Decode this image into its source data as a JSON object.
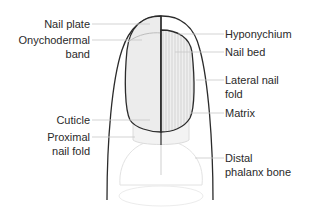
{
  "diagram": {
    "labels_left": [
      {
        "id": "nail-plate",
        "lines": [
          "Nail plate"
        ]
      },
      {
        "id": "onychodermal-band",
        "lines": [
          "Onychodermal",
          "band"
        ]
      },
      {
        "id": "cuticle",
        "lines": [
          "Cuticle"
        ]
      },
      {
        "id": "proximal-nail-fold",
        "lines": [
          "Proximal",
          "nail fold"
        ]
      }
    ],
    "labels_right": [
      {
        "id": "hyponychium",
        "lines": [
          "Hyponychium"
        ]
      },
      {
        "id": "nail-bed",
        "lines": [
          "Nail bed"
        ]
      },
      {
        "id": "lateral-nail-fold",
        "lines": [
          "Lateral nail",
          "fold"
        ]
      },
      {
        "id": "matrix",
        "lines": [
          "Matrix"
        ]
      },
      {
        "id": "distal-phalanx-bone",
        "lines": [
          "Distal",
          "phalanx bone"
        ]
      }
    ],
    "colors": {
      "outline": "#2b2b2b",
      "leader": "#c8c8c8",
      "nail_fill": "#e9e9e9",
      "text": "#2a2a2a"
    }
  }
}
